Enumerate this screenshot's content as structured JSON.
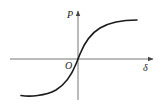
{
  "diagram": {
    "type": "function-curve",
    "axes": {
      "x_label": "δ",
      "y_label": "P",
      "origin_label": "O"
    },
    "curve": {
      "shape": "sigmoid",
      "passes_through_origin": true,
      "upper_plateau": "positive saturation",
      "lower_plateau": "negative saturation"
    },
    "colors": {
      "axis": "#555555",
      "curve": "#1a1a1a",
      "background": "#ffffff"
    }
  }
}
